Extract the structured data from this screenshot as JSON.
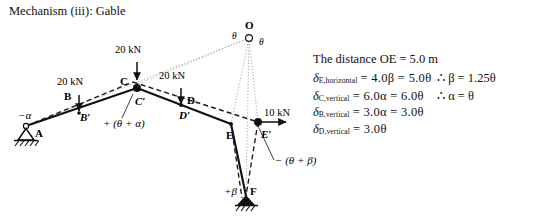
{
  "title": "Mechanism (iii): Gable",
  "figure": {
    "points": [
      {
        "name": "A",
        "label": "A"
      },
      {
        "name": "B",
        "label": "B"
      },
      {
        "name": "Bp",
        "label": "B′"
      },
      {
        "name": "C",
        "label": "C"
      },
      {
        "name": "Cp",
        "label": "C′"
      },
      {
        "name": "D",
        "label": "D"
      },
      {
        "name": "Dp",
        "label": "D′"
      },
      {
        "name": "E",
        "label": "E"
      },
      {
        "name": "Ep",
        "label": "E′"
      },
      {
        "name": "F",
        "label": "F"
      },
      {
        "name": "O",
        "label": "O"
      }
    ],
    "loads": [
      {
        "name": "load-B",
        "label": "20 kN"
      },
      {
        "name": "load-C",
        "label": "20 kN"
      },
      {
        "name": "load-D",
        "label": "20 kN"
      },
      {
        "name": "load-E",
        "label": "10 kN"
      }
    ],
    "angles": [
      {
        "name": "angle-A",
        "label": "−α"
      },
      {
        "name": "angle-C",
        "label": "+ (θ + α)"
      },
      {
        "name": "angle-E",
        "label": "− (θ + β)"
      },
      {
        "name": "angle-F",
        "label": "+β"
      },
      {
        "name": "angle-O-left",
        "label": "θ"
      },
      {
        "name": "angle-O-right",
        "label": "θ"
      }
    ]
  },
  "notes": {
    "distance_line": "The distance OE = 5.0 m",
    "equations": [
      {
        "symbol": "δ",
        "subscript": "E,horizontal",
        "body": "= 4.0β = 5.0θ",
        "result": "∴  β = 1.25θ"
      },
      {
        "symbol": "δ",
        "subscript": "C,vertical",
        "body": "= 6.0α = 6.0θ",
        "result": "∴  α = θ"
      },
      {
        "symbol": "δ",
        "subscript": "B,vertical",
        "body": "= 3.0α = 3.0θ",
        "result": ""
      },
      {
        "symbol": "δ",
        "subscript": "D,vertical",
        "body": "= 3.0θ",
        "result": ""
      }
    ]
  },
  "colors": {
    "ink": "#111111",
    "dashed": "#1a1a1a",
    "dotted": "#9a9a9a"
  }
}
